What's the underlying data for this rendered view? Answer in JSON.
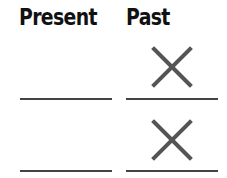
{
  "headers": {
    "present": "Present",
    "past": "Past"
  },
  "rows": [
    {
      "present": "",
      "past": "",
      "past_mark": "x-mark"
    },
    {
      "present": "",
      "past": "",
      "past_mark": "x-mark"
    }
  ],
  "colors": {
    "text": "#111111",
    "line": "#444444",
    "mark": "#555555"
  }
}
